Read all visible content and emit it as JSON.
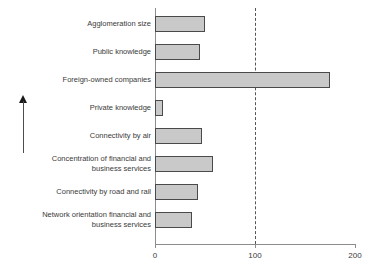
{
  "chart_data": {
    "type": "bar",
    "orientation": "horizontal",
    "title": "",
    "subtitle": "",
    "xlabel": "",
    "ylabel": "",
    "categories": [
      "Agglomeration size",
      "Public knowledge",
      "Foreign-owned companies",
      "Private knowledge",
      "Connectivity by air",
      "Concentration of financial and business services",
      "Connectivity by road and rail",
      "Network orientation financial and business services"
    ],
    "category_lines": [
      [
        "Agglomeration size"
      ],
      [
        "Public knowledge"
      ],
      [
        "Foreign-owned companies"
      ],
      [
        "Private knowledge"
      ],
      [
        "Connectivity by air"
      ],
      [
        "Concentration of financial and",
        "business services"
      ],
      [
        "Connectivity by road and rail"
      ],
      [
        "Network orientation financial and",
        "business services"
      ]
    ],
    "values": [
      50,
      45,
      175,
      8,
      47,
      58,
      43,
      37
    ],
    "xlim": [
      0,
      200
    ],
    "xticks": [
      0,
      100,
      200
    ],
    "xtick_labels": [
      "0",
      "100",
      "200"
    ],
    "reference_line": {
      "value": 100,
      "style": "dashed",
      "label": ""
    },
    "grid": false,
    "legend": null,
    "bar_fill_color": "#c9c9c9",
    "bar_border_color": "#4a4a4a",
    "axis_color": "#8c8c8c",
    "reference_line_color": "#555555",
    "annotations": [
      {
        "name": "rank-direction-arrow",
        "type": "arrow",
        "direction": "up",
        "text": ""
      }
    ]
  }
}
